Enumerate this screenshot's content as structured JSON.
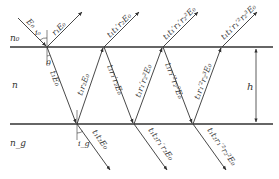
{
  "diagram": {
    "media": {
      "top": "n₀",
      "film": "n",
      "substrate": "n_g"
    },
    "thickness_label": "h",
    "angles": {
      "incidence": "i₀",
      "refraction": "θ",
      "substrate": "i_g"
    },
    "incident_label": "E₀",
    "reflected_labels": [
      "r₁E₀",
      "t₁t₁′r₂E₀",
      "t₁t₁′r₁′r₂²E₀",
      "t₁t₁′r₁′²r₂³E₀"
    ],
    "internal_labels": [
      "t₁E₀",
      "t₁r₂E₀",
      "t₁r₁′r₂E₀",
      "t₁r₁′r₂²E₀",
      "t₁r₁′²r₂²E₀",
      "t₁r₁′²r₂³E₀"
    ],
    "transmitted_labels": [
      "t₁t₂E₀",
      "t₁t₂r₁′r₂E₀",
      "t₁t₂r₁′²r₂²E₀"
    ],
    "colors": {
      "line": "#333333",
      "background": "#ffffff"
    }
  }
}
